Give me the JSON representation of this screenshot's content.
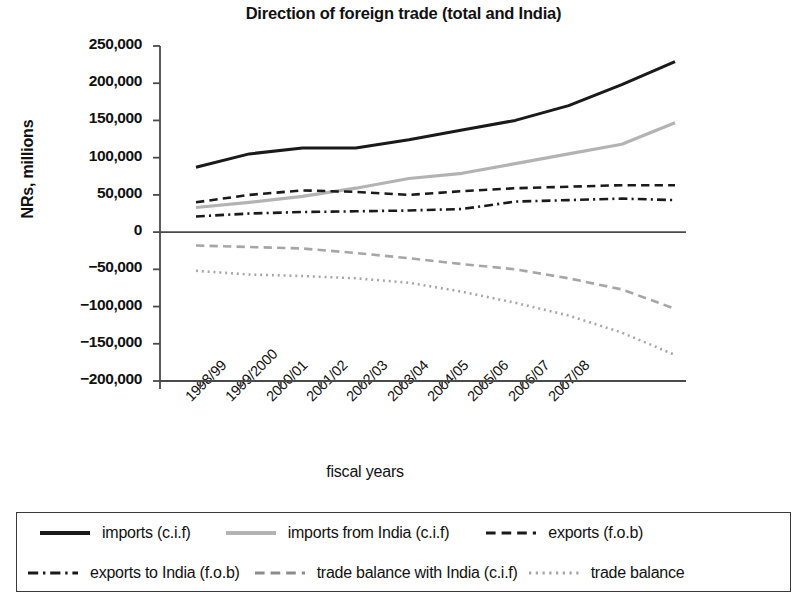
{
  "chart_data": {
    "type": "line",
    "title": "Direction of foreign trade (total and India)",
    "xlabel": "fiscal years",
    "ylabel": "NRs, millions",
    "grid": false,
    "legend_position": "bottom",
    "ylim": [
      -200000,
      250000
    ],
    "ytick_step": 50000,
    "ytick_labels": [
      "250,000",
      "200,000",
      "150,000",
      "100,000",
      "50,000",
      "0",
      "−50,000",
      "−100,000",
      "−150,000",
      "−200,000"
    ],
    "ytick_values": [
      250000,
      200000,
      150000,
      100000,
      50000,
      0,
      -50000,
      -100000,
      -150000,
      -200000
    ],
    "categories": [
      "1998/99",
      "1999/2000",
      "2000/01",
      "2001/02",
      "2002/03",
      "2003/04",
      "2004/05",
      "2005/06",
      "2006/07",
      "2007/08"
    ],
    "series": [
      {
        "name": "imports (c.i.f)",
        "style": "solid",
        "color": "#1a1a1a",
        "width": 3.0,
        "values": [
          87000,
          105000,
          113000,
          113000,
          124000,
          137000,
          150000,
          170000,
          198000,
          229000
        ]
      },
      {
        "name": "imports from India (c.i.f)",
        "style": "solid",
        "color": "#b3b3b3",
        "width": 3.2,
        "values": [
          33000,
          40000,
          48000,
          59000,
          72000,
          79000,
          92000,
          105000,
          118000,
          147000
        ]
      },
      {
        "name": "exports (f.o.b)",
        "style": "dashed",
        "color": "#1a1a1a",
        "width": 2.6,
        "values": [
          40000,
          50000,
          56000,
          54000,
          50000,
          55000,
          59000,
          61000,
          63000,
          63000
        ]
      },
      {
        "name": "exports to India (f.o.b)",
        "style": "dashdot",
        "color": "#1a1a1a",
        "width": 2.6,
        "values": [
          21000,
          25000,
          27000,
          28000,
          29000,
          31000,
          41000,
          43000,
          45000,
          43000
        ]
      },
      {
        "name": "trade balance with India (c.i.f)",
        "style": "dashed",
        "color": "#a6a6a6",
        "width": 2.6,
        "values": [
          -18000,
          -20000,
          -22000,
          -28000,
          -35000,
          -43000,
          -50000,
          -62000,
          -77000,
          -103000
        ]
      },
      {
        "name": "trade balance",
        "style": "dotted",
        "color": "#a6a6a6",
        "width": 2.6,
        "values": [
          -52000,
          -57000,
          -59000,
          -62000,
          -68000,
          -80000,
          -95000,
          -112000,
          -135000,
          -165000
        ]
      }
    ]
  },
  "legend": {
    "items": [
      {
        "label": "imports (c.i.f)",
        "style": "solid",
        "color": "#1a1a1a",
        "width": 4
      },
      {
        "label": "imports from India (c.i.f)",
        "style": "solid",
        "color": "#b3b3b3",
        "width": 4
      },
      {
        "label": "exports (f.o.b)",
        "style": "dashed",
        "color": "#1a1a1a",
        "width": 3
      },
      {
        "label": "exports to India (f.o.b)",
        "style": "dashdot",
        "color": "#1a1a1a",
        "width": 3
      },
      {
        "label": "trade balance with India (c.i.f)",
        "style": "dashed",
        "color": "#8c8c8c",
        "width": 3
      },
      {
        "label": "trade balance",
        "style": "dotted",
        "color": "#a6a6a6",
        "width": 3
      }
    ]
  }
}
